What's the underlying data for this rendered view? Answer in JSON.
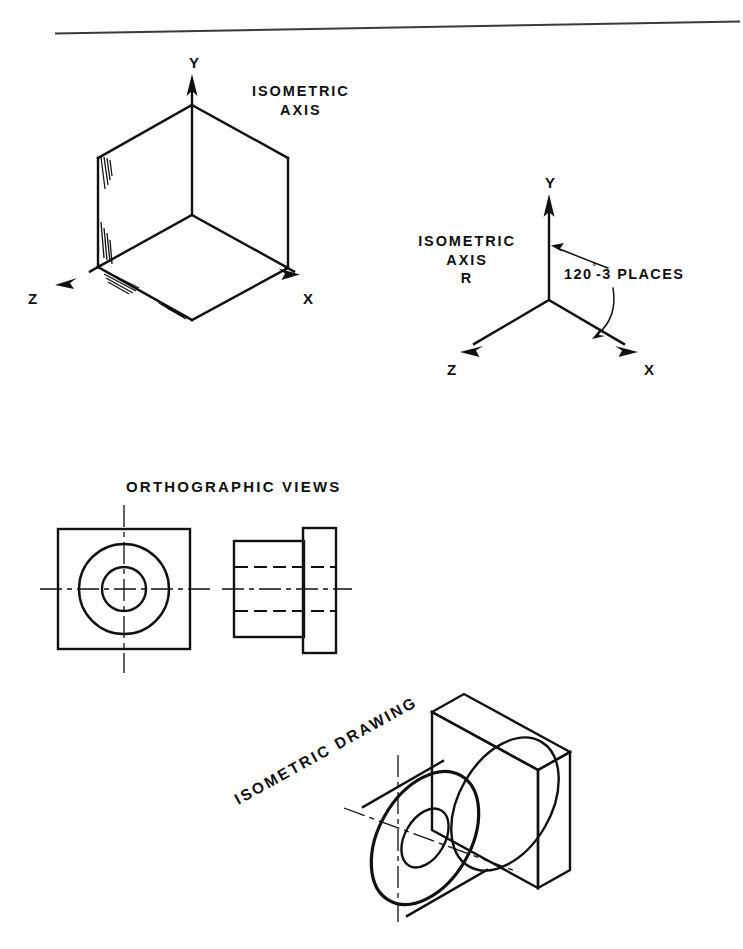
{
  "page": {
    "background_color": "#fefefe",
    "ink_color": "#111111",
    "width": 743,
    "height": 949
  },
  "top_rule": {
    "name": "horizontal-rule",
    "color": "#3b3b3b"
  },
  "isometric_cube": {
    "heading_line1": "ISOMETRIC",
    "heading_line2": "AXIS",
    "axis_labels": {
      "y": "Y",
      "x": "X",
      "z": "Z"
    }
  },
  "isometric_axis_r": {
    "heading_line1": "ISOMETRIC",
    "heading_line2": "AXIS",
    "heading_line3": "R",
    "angle_note": "120",
    "angle_degree_symbol": "°",
    "angle_note_suffix": "-3 PLACES",
    "axis_labels": {
      "y": "Y",
      "x": "X",
      "z": "Z"
    }
  },
  "orthographic": {
    "heading": "ORTHOGRAPHIC VIEWS",
    "views": [
      {
        "name": "front-view",
        "description": "square outline with two concentric circles and centerlines"
      },
      {
        "name": "side-view",
        "description": "cylindrical body with flange plate and hidden bore lines"
      }
    ]
  },
  "isometric_drawing": {
    "heading": "ISOMETRIC DRAWING",
    "heading_rotation_degrees": -29,
    "description": "rectangular plate with cylindrical boss and through bore"
  }
}
